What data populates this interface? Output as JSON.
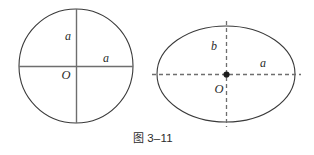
{
  "figure": {
    "caption_prefix": "图",
    "caption_number": "3–11",
    "caption_full": "图 3–11",
    "background_color": "#ffffff",
    "stroke_color": "#3a3a3a",
    "axis_color": "#6b6b6b",
    "label_color": "#2b2b2b"
  },
  "circle_figure": {
    "name": "circle-with-radii",
    "center_label": "O",
    "vertical_radius_label": "a",
    "horizontal_radius_label": "a",
    "center": {
      "x": 76,
      "y": 66
    },
    "radius": 57,
    "axis_style": "solid"
  },
  "ellipse_figure": {
    "name": "ellipse-with-semi-axes",
    "center_label": "O",
    "semi_minor_label": "b",
    "semi_major_label": "a",
    "center": {
      "x": 226,
      "y": 74
    },
    "radius_x": 69,
    "radius_y": 48,
    "axis_style": "dashed",
    "center_marker": "filled-dot"
  }
}
